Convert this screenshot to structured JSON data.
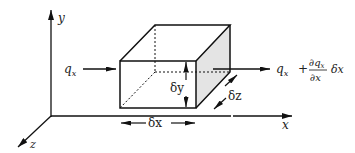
{
  "diagram": {
    "type": "control-volume-flux",
    "axes": {
      "x_label": "x",
      "y_label": "y",
      "z_label": "z"
    },
    "inflow": {
      "label": "q",
      "subscript": "x"
    },
    "outflow": {
      "term1": "q",
      "term1_sub": "x",
      "plus": "+",
      "numerator": "∂q",
      "numerator_sub": "x",
      "denominator": "∂x",
      "multiplier": "δx"
    },
    "dimensions": {
      "dx": "δx",
      "dy": "δy",
      "dz": "δz"
    },
    "colors": {
      "line": "#111111",
      "shade": "#e4e4e4"
    }
  }
}
